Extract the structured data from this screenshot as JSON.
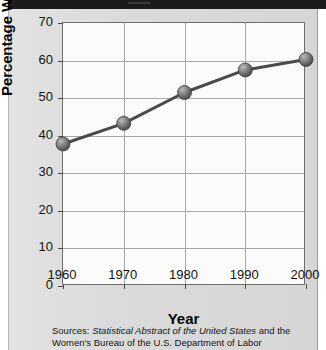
{
  "figure": {
    "background_color": "#dcdcdc",
    "plot_background_color": "#fbfbfb",
    "line_color": "#4a4a4a",
    "marker_color": "#6e6e6e"
  },
  "axes": {
    "x_title": "Year",
    "y_title": "Percentage Working",
    "x_ticks": [
      "1960",
      "1970",
      "1980",
      "1990",
      "2000"
    ],
    "y_ticks": [
      "0",
      "10",
      "20",
      "30",
      "40",
      "50",
      "60",
      "70"
    ]
  },
  "sources": {
    "prefix": "Sources: ",
    "italic_title": "Statistical Abstract of the United States",
    "suffix": " and the Women's Bureau of the U.S. Department of Labor"
  },
  "chart_data": {
    "type": "line",
    "title": "",
    "xlabel": "Year",
    "ylabel": "Percentage Working",
    "x": [
      1960,
      1970,
      1980,
      1990,
      2000
    ],
    "categories": [
      "1960",
      "1970",
      "1980",
      "1990",
      "2000"
    ],
    "values": [
      37.8,
      43.3,
      51.5,
      57.5,
      60.3
    ],
    "series": [
      {
        "name": "Percentage Working",
        "values": [
          37.8,
          43.3,
          51.5,
          57.5,
          60.3
        ]
      }
    ],
    "xlim": [
      1960,
      2000
    ],
    "ylim": [
      0,
      70
    ],
    "y_tick_values": [
      0,
      10,
      20,
      30,
      40,
      50,
      60,
      70
    ],
    "x_tick_values": [
      1960,
      1970,
      1980,
      1990,
      2000
    ],
    "grid": true,
    "legend": false,
    "markers": "sphere",
    "marker_radius_px": 7
  }
}
